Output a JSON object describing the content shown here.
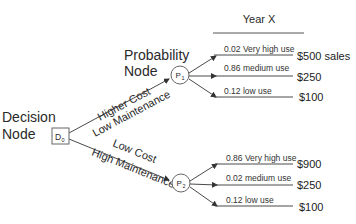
{
  "header": {
    "title": "Year X"
  },
  "decision_node": {
    "label_line1": "Decision",
    "label_line2": "Node",
    "symbol": "D",
    "subscript": "0"
  },
  "probability_label": {
    "line1": "Probability",
    "line2": "Node"
  },
  "options": [
    {
      "line1": "Higher Cost",
      "line2": "Low Maintenance",
      "node_symbol": "P",
      "node_subscript": "1",
      "outcomes": [
        {
          "probability": "0.02",
          "label": "Very high use",
          "text": "0.02 Very high use",
          "payoff": "$500 sales"
        },
        {
          "probability": "0.86",
          "label": "medium use",
          "text": "0.86 medium use",
          "payoff": "$250"
        },
        {
          "probability": "0.12",
          "label": "low use",
          "text": "0.12 low use",
          "payoff": "$100"
        }
      ]
    },
    {
      "line1": "Low Cost",
      "line2": "High Maintenance",
      "node_symbol": "P",
      "node_subscript": "2",
      "outcomes": [
        {
          "probability": "0.86",
          "label": "Very high use",
          "text": "0.86 Very high use",
          "payoff": "$900"
        },
        {
          "probability": "0.02",
          "label": "medium use",
          "text": "0.02 medium use",
          "payoff": "$250"
        },
        {
          "probability": "0.12",
          "label": "low use",
          "text": "0.12 low use",
          "payoff": "$100"
        }
      ]
    }
  ]
}
